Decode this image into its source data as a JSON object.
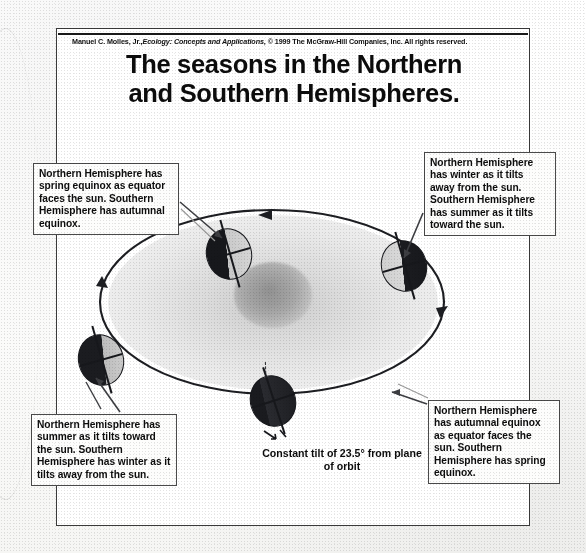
{
  "figure": {
    "credit": {
      "author": "Manuel C. Molles, Jr.,",
      "work": "Ecology: Concepts and Applications",
      "rights": ", © 1999 The McGraw-Hill Companies, Inc. All rights reserved."
    },
    "title_line1": "The seasons in the Northern",
    "title_line2": "and Southern Hemispheres."
  },
  "callouts": {
    "spring_equinox": "Northern Hemisphere has spring equinox as equator faces the sun. Southern Hemisphere has autumnal equinox.",
    "nh_winter": "Northern Hemisphere has winter as it tilts away from the sun. Southern Hemisphere has summer as it tilts toward the sun.",
    "nh_summer": "Northern Hemisphere has summer as it tilts toward the sun. Southern Hemisphere has winter as it tilts away from the sun.",
    "autumnal_equinox": "Northern Hemisphere has autumnal equinox as equator faces the sun. Southern Hemisphere has spring equinox."
  },
  "caption": {
    "tilt": "Constant tilt of 23.5° from plane of orbit"
  },
  "diagram": {
    "tilt_degrees": "23.5",
    "sun_label": "sun",
    "orbit_direction": "counterclockwise",
    "earth_positions": [
      {
        "name": "spring-equinox-earth",
        "season_northern": "spring equinox"
      },
      {
        "name": "winter-solstice-earth",
        "season_northern": "winter"
      },
      {
        "name": "summer-solstice-earth",
        "season_northern": "summer"
      },
      {
        "name": "autumnal-equinox-earth",
        "season_northern": "autumnal equinox"
      }
    ]
  },
  "colors": {
    "ink": "#111111",
    "frame": "#3a3a3a",
    "orbit_fill": "#9a9a9a",
    "globe_dark": "#17181c",
    "globe_light": "#d4d4d4",
    "page": "#ffffff"
  }
}
